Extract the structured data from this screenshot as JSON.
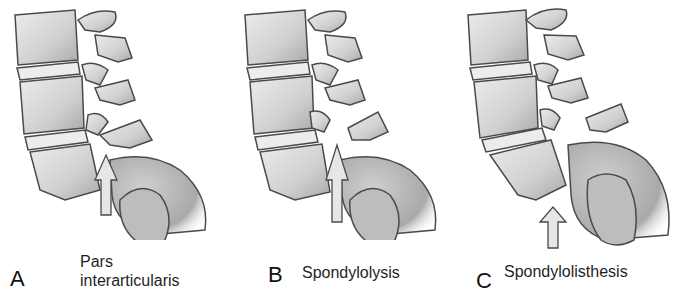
{
  "figure": {
    "panels": [
      {
        "letter": "A",
        "caption_line1": "Pars",
        "caption_line2": "interarticularis",
        "arrow_target": "pars interarticularis (intact)"
      },
      {
        "letter": "B",
        "caption": "Spondylolysis",
        "arrow_target": "defect in pars interarticularis"
      },
      {
        "letter": "C",
        "caption": "Spondylolisthesis",
        "arrow_target": "anterior slip of L5 on sacrum"
      }
    ],
    "colors": {
      "bone_fill": "#d9d9d9",
      "bone_shade": "#b5b5b5",
      "outline": "#4a4a4a",
      "arrow_fill": "#e6e6e6",
      "background": "#ffffff"
    }
  }
}
